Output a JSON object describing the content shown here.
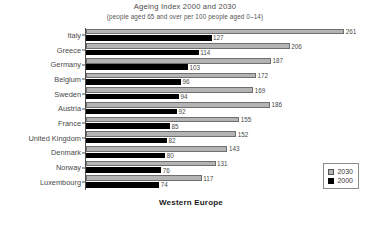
{
  "chart_data": {
    "type": "bar",
    "orientation": "horizontal",
    "title": "Ageing Index 2000 and 2030",
    "subtitle": "(people aged 65 and over per 100 people aged 0–14)",
    "xlabel": "Western Europe",
    "ylabel": "",
    "grid": false,
    "legend_position": "bottom-right",
    "xlim": [
      0,
      275
    ],
    "categories": [
      "Italy",
      "Greece",
      "Germany",
      "Belgium",
      "Sweden",
      "Austria",
      "France",
      "United Kingdom",
      "Denmark",
      "Norway",
      "Luxembourg"
    ],
    "series": [
      {
        "name": "2030",
        "color": "#b4b4b4",
        "values": [
          261,
          206,
          187,
          172,
          169,
          186,
          155,
          152,
          143,
          131,
          117
        ]
      },
      {
        "name": "2000",
        "color": "#000000",
        "values": [
          127,
          114,
          103,
          96,
          94,
          92,
          85,
          82,
          80,
          76,
          74
        ]
      }
    ]
  },
  "legend": {
    "items": [
      {
        "label": "2030",
        "swatch": "light-gray"
      },
      {
        "label": "2000",
        "swatch": "black"
      }
    ]
  }
}
